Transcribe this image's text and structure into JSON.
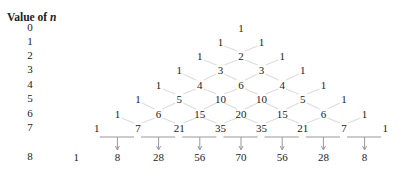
{
  "title": {
    "prefix": "Value of ",
    "variable": "n"
  },
  "row_labels": [
    "0",
    "1",
    "2",
    "3",
    "4",
    "5",
    "6",
    "7",
    "8"
  ],
  "rows": [
    [
      "1"
    ],
    [
      "1",
      "1"
    ],
    [
      "1",
      "2",
      "1"
    ],
    [
      "1",
      "3",
      "3",
      "1"
    ],
    [
      "1",
      "4",
      "6",
      "4",
      "1"
    ],
    [
      "1",
      "5",
      "10",
      "10",
      "5",
      "1"
    ],
    [
      "1",
      "6",
      "15",
      "20",
      "15",
      "6",
      "1"
    ],
    [
      "1",
      "7",
      "21",
      "35",
      "35",
      "21",
      "7",
      "1"
    ],
    [
      "1",
      "8",
      "28",
      "56",
      "70",
      "56",
      "28",
      "8"
    ]
  ],
  "colors": {
    "text": "#222222",
    "connector": "#dddddd",
    "bracket": "#999999"
  }
}
